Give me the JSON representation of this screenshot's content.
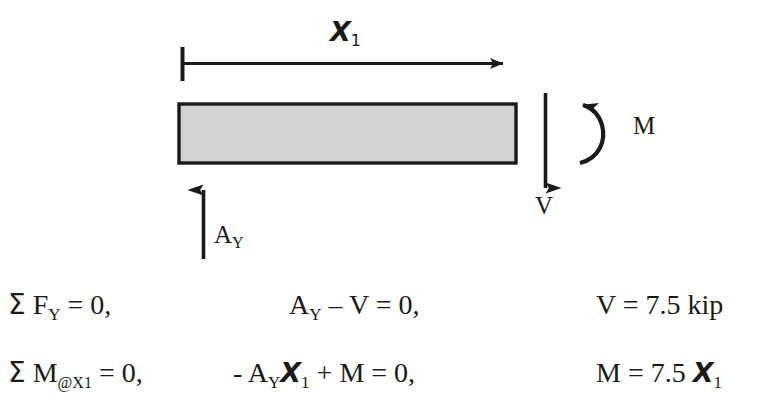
{
  "figure": {
    "type": "free-body-diagram",
    "dimension": {
      "label_base": "X",
      "label_sub": "1",
      "arrow_direction": "right",
      "tick_at_left": true
    },
    "beam": {
      "fill_color": "#d2d2d2",
      "border_color": "#1a1a1a"
    },
    "loads": [
      {
        "name": "reaction",
        "label_base": "A",
        "label_sub": "Y",
        "arrow_direction": "up"
      },
      {
        "name": "shear",
        "label_base": "V",
        "label_sub": "",
        "arrow_direction": "down"
      },
      {
        "name": "moment",
        "label_base": "M",
        "label_sub": "",
        "arrow_direction": "counterclockwise-curved"
      }
    ]
  },
  "equations": {
    "row1": {
      "sum_expression_sigma": "Σ",
      "sum_expression_base": " F",
      "sum_expression_sub": "Y",
      "sum_expression_tail": " = 0,",
      "equilibrium_lead": "A",
      "equilibrium_lead_sub": "Y",
      "equilibrium_tail": " – V = 0,",
      "result": "V = 7.5 kip"
    },
    "row2": {
      "sum_expression_sigma": "Σ",
      "sum_expression_base": " M",
      "sum_expression_sub": "@X1",
      "sum_expression_tail": " = 0,",
      "equilibrium_lead": "- A",
      "equilibrium_lead_sub": "Y",
      "equilibrium_x": "X",
      "equilibrium_x_sub": "1",
      "equilibrium_tail": " + M = 0,",
      "result_lead": "M = 7.5 ",
      "result_x": "X",
      "result_x_sub": "1"
    }
  },
  "colors": {
    "ink": "#1a1a1a",
    "beam_fill": "#d2d2d2",
    "background": "#ffffff"
  }
}
